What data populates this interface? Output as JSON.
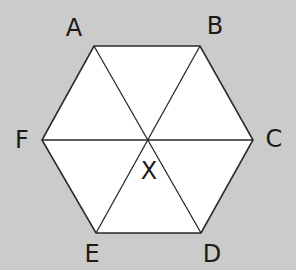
{
  "diagram": {
    "colors": {
      "background": "#cbcbcb",
      "fill": "#ffffff",
      "stroke": "#2a2a2a",
      "label": "#1a1a1a"
    },
    "vertices": [
      {
        "name": "A",
        "x": 94,
        "y": 46,
        "label_x": 74,
        "label_y": 28
      },
      {
        "name": "B",
        "x": 200,
        "y": 46,
        "label_x": 215,
        "label_y": 26
      },
      {
        "name": "C",
        "x": 253,
        "y": 140,
        "label_x": 274,
        "label_y": 139
      },
      {
        "name": "D",
        "x": 201,
        "y": 233,
        "label_x": 212,
        "label_y": 254
      },
      {
        "name": "E",
        "x": 96,
        "y": 233,
        "label_x": 92,
        "label_y": 254
      },
      {
        "name": "F",
        "x": 42,
        "y": 140,
        "label_x": 22,
        "label_y": 140
      }
    ],
    "center": {
      "name": "X",
      "x": 148,
      "y": 140,
      "label_x": 149,
      "label_y": 171
    },
    "edges": [
      "AB",
      "BC",
      "CD",
      "DE",
      "EF",
      "FA"
    ],
    "diagonals": [
      "AD",
      "BE",
      "CF"
    ]
  }
}
